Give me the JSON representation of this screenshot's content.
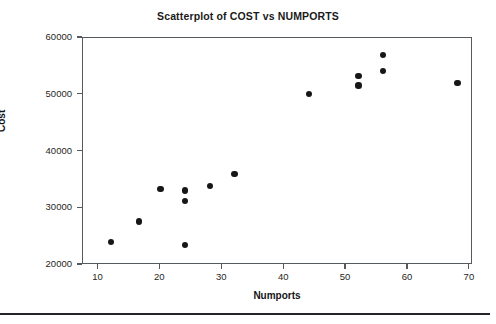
{
  "chart_data": {
    "type": "scatter",
    "title": "Scatterplot of COST vs NUMPORTS",
    "xlabel": "Numports",
    "ylabel": "Cost",
    "xlim": [
      7.5,
      70.5
    ],
    "ylim": [
      20000,
      60000
    ],
    "xticks": [
      10,
      20,
      30,
      40,
      50,
      60,
      70
    ],
    "yticks": [
      20000,
      30000,
      40000,
      50000,
      60000
    ],
    "xtick_labels": [
      "10",
      "20",
      "30",
      "40",
      "50",
      "60",
      "70"
    ],
    "ytick_labels": [
      "20000",
      "30000",
      "40000",
      "50000",
      "60000"
    ],
    "grid": false,
    "legend": null,
    "marker": "filled-circle",
    "marker_color": "#17171a",
    "points": [
      {
        "x": 12,
        "y": 24100
      },
      {
        "x": 16.5,
        "y": 27700
      },
      {
        "x": 20,
        "y": 33400
      },
      {
        "x": 24,
        "y": 33100
      },
      {
        "x": 24,
        "y": 31300
      },
      {
        "x": 24,
        "y": 23500
      },
      {
        "x": 28,
        "y": 33900
      },
      {
        "x": 32,
        "y": 36000
      },
      {
        "x": 44,
        "y": 50100
      },
      {
        "x": 52,
        "y": 53300
      },
      {
        "x": 52,
        "y": 51600
      },
      {
        "x": 56,
        "y": 57000
      },
      {
        "x": 56,
        "y": 54200
      },
      {
        "x": 68,
        "y": 52100
      }
    ]
  },
  "colors": {
    "axis": "#555a5e",
    "text": "#1f1f22",
    "marker": "#17171a",
    "rule": "#24242a",
    "background": "#ffffff"
  }
}
